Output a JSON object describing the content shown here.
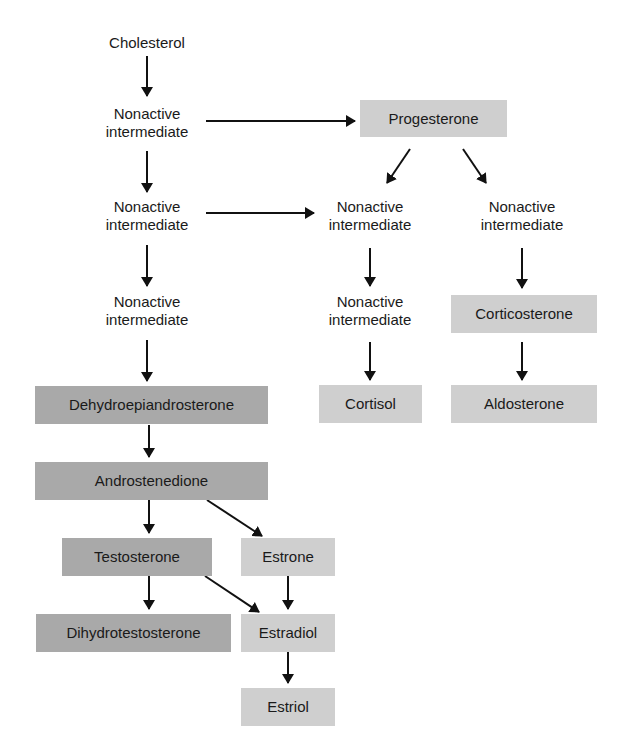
{
  "colors": {
    "androgen_box": "#a9a9a9",
    "other_box": "#cfcfcf",
    "arrow": "#111111",
    "background": "#ffffff"
  },
  "nodes": {
    "cholesterol": "Cholesterol",
    "intermediate_1": "Nonactive intermediate",
    "intermediate_2": "Nonactive intermediate",
    "intermediate_3": "Nonactive intermediate",
    "progesterone": "Progesterone",
    "intermediate_mid_1": "Nonactive intermediate",
    "intermediate_mid_2": "Nonactive intermediate",
    "intermediate_right_1": "Nonactive intermediate",
    "dehydroepiandrosterone": "Dehydroepiandrosterone",
    "androstenedione": "Androstenedione",
    "testosterone": "Testosterone",
    "estrone": "Estrone",
    "dihydrotestosterone": "Dihydrotestosterone",
    "estradiol": "Estradiol",
    "estriol": "Estriol",
    "cortisol": "Cortisol",
    "corticosterone": "Corticosterone",
    "aldosterone": "Aldosterone"
  },
  "edges": [
    [
      "cholesterol",
      "intermediate_1"
    ],
    [
      "intermediate_1",
      "progesterone"
    ],
    [
      "intermediate_1",
      "intermediate_2"
    ],
    [
      "intermediate_2",
      "intermediate_mid_1"
    ],
    [
      "intermediate_2",
      "intermediate_3"
    ],
    [
      "intermediate_3",
      "dehydroepiandrosterone"
    ],
    [
      "progesterone",
      "intermediate_mid_1"
    ],
    [
      "progesterone",
      "intermediate_right_1"
    ],
    [
      "intermediate_mid_1",
      "intermediate_mid_2"
    ],
    [
      "intermediate_mid_2",
      "cortisol"
    ],
    [
      "intermediate_right_1",
      "corticosterone"
    ],
    [
      "corticosterone",
      "aldosterone"
    ],
    [
      "dehydroepiandrosterone",
      "androstenedione"
    ],
    [
      "androstenedione",
      "testosterone"
    ],
    [
      "androstenedione",
      "estrone"
    ],
    [
      "testosterone",
      "dihydrotestosterone"
    ],
    [
      "testosterone",
      "estradiol"
    ],
    [
      "estrone",
      "estradiol"
    ],
    [
      "estradiol",
      "estriol"
    ]
  ]
}
